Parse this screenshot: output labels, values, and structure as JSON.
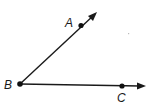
{
  "diagram": {
    "type": "angle",
    "vertex": {
      "name": "B",
      "label": "B"
    },
    "points": [
      {
        "name": "A",
        "label": "A"
      },
      {
        "name": "B",
        "label": "B"
      },
      {
        "name": "C",
        "label": "C"
      }
    ],
    "rays": [
      {
        "name": "ray-BA",
        "from": "B",
        "through": "A",
        "arrow": true
      },
      {
        "name": "ray-BC",
        "from": "B",
        "through": "C",
        "arrow": true
      }
    ],
    "colors": {
      "ink": "#1a1a1a",
      "background": "#ffffff"
    }
  }
}
